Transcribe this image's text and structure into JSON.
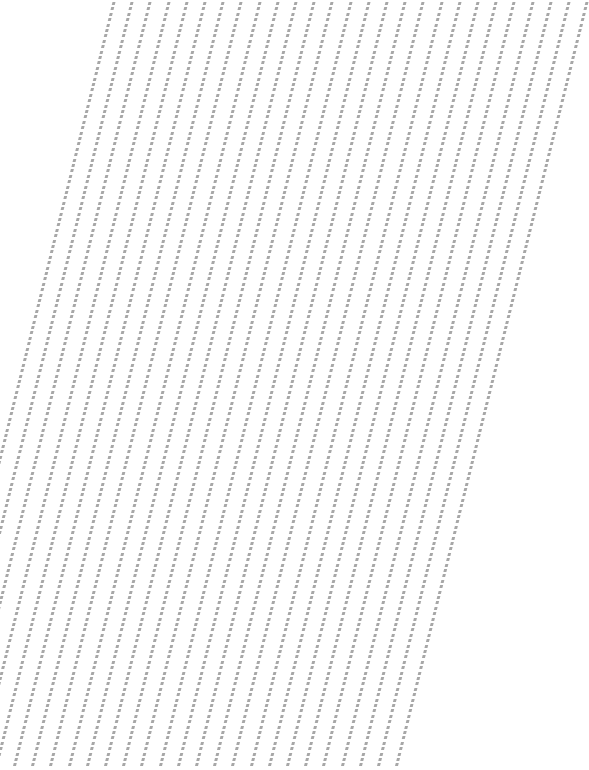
{
  "pattern": {
    "type": "vertical dashed slash columns",
    "column_count": 27,
    "start_x": 17,
    "pitch_x": 18.2,
    "mark_spacing_y": 5.4,
    "mark_color": "#8a8a8a",
    "background_color": "#ffffff"
  }
}
